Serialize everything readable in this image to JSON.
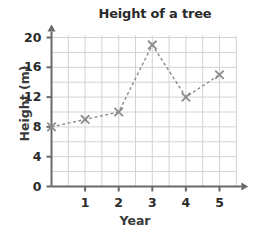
{
  "chart_data": {
    "type": "line",
    "title": "Height of a tree",
    "xlabel": "Year",
    "ylabel": "Height (m)",
    "x": [
      0,
      1,
      2,
      3,
      4,
      5
    ],
    "values": [
      8,
      9,
      10,
      19,
      12,
      15
    ],
    "xlim": [
      0,
      5.6
    ],
    "ylim": [
      0,
      20.6
    ],
    "x_tick_labels": [
      "1",
      "2",
      "3",
      "4",
      "5"
    ],
    "x_ticks": [
      1,
      2,
      3,
      4,
      5
    ],
    "y_tick_labels": [
      "0",
      "4",
      "8",
      "12",
      "16",
      "20"
    ],
    "y_ticks": [
      0,
      4,
      8,
      12,
      16,
      20
    ],
    "grid": true,
    "grid_x_step": 0.5,
    "grid_y_step": 2,
    "legend": null,
    "marker": "x",
    "line_style": "dashed",
    "series_color": "#8c8c8c",
    "grid_color": "#d0d3d8",
    "axis_color": "#6a6a6a"
  }
}
